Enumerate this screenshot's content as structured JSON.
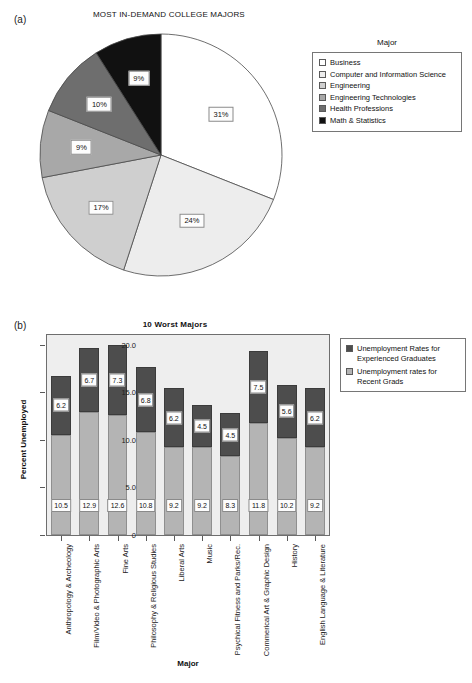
{
  "figure": {
    "panel_a_letter": "(a)",
    "panel_b_letter": "(b)"
  },
  "chart_data": [
    {
      "type": "pie",
      "panel": "(a)",
      "title": "MOST IN-DEMAND COLLEGE MAJORS",
      "legend_title": "Major",
      "legend_position": "right",
      "categories": [
        "Business",
        "Computer and Information Science",
        "Engineering",
        "Engineering Technologies",
        "Health Professions",
        "Math & Statistics"
      ],
      "values": [
        31,
        24,
        17,
        9,
        10,
        9
      ],
      "labels": [
        "31%",
        "24%",
        "17%",
        "9%",
        "10%",
        "9%"
      ],
      "colors": [
        "#ffffff",
        "#ededed",
        "#cfcfcf",
        "#a8a8a8",
        "#6e6e6e",
        "#111111"
      ],
      "start_angle_deg": 0,
      "direction": "clockwise"
    },
    {
      "type": "bar",
      "subtype": "stacked",
      "panel": "(b)",
      "title": "10 Worst Majors",
      "xlabel": "Major",
      "ylabel": "Percent Unemployed",
      "ylim": [
        0,
        21
      ],
      "yticks": [
        "0",
        "5.0",
        "10.0",
        "15.0",
        "20.0"
      ],
      "ytick_values": [
        0,
        5,
        10,
        15,
        20
      ],
      "grid": false,
      "legend_position": "right",
      "categories": [
        "Anthropology & Archeology",
        "Film/Video & Photographic Arts",
        "Fine Arts",
        "Philosophy & Religious Studies",
        "Liberal Arts",
        "Music",
        "Psychical Fitness and Parks/Rec.",
        "Commerical Art & Graphic Design",
        "History",
        "English Language & Literature"
      ],
      "series": [
        {
          "name": "Unemployment rates for Recent Grads",
          "color": "#b4b4b4",
          "values": [
            10.5,
            12.9,
            12.6,
            10.8,
            9.2,
            9.2,
            8.3,
            11.8,
            10.2,
            9.2
          ]
        },
        {
          "name": "Unemployment Rates for Experienced Graduates",
          "color": "#4d4d4d",
          "values": [
            6.2,
            6.7,
            7.3,
            6.8,
            6.2,
            4.5,
            4.5,
            7.5,
            5.6,
            6.2
          ]
        }
      ],
      "legend_entries": [
        "Unemployment Rates for Experienced Graduates",
        "Unemployment rates for Recent Grads"
      ]
    }
  ]
}
